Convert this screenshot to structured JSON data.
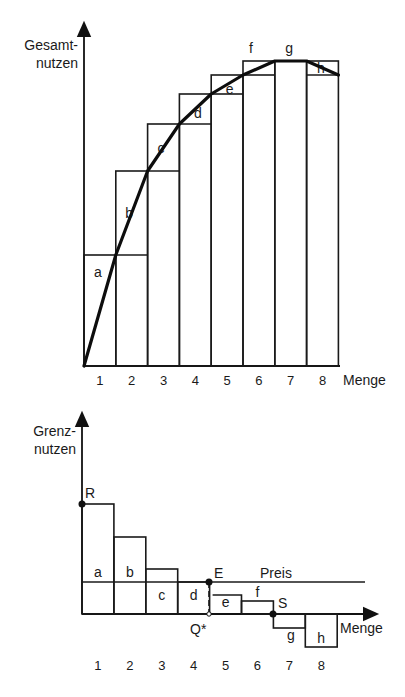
{
  "top_chart": {
    "y_axis_label_line1": "Gesamt-",
    "y_axis_label_line2": "nutzen",
    "x_axis_label": "Menge",
    "x_ticks": [
      "1",
      "2",
      "3",
      "4",
      "5",
      "6",
      "7",
      "8"
    ],
    "segment_labels": [
      "a",
      "b",
      "c",
      "d",
      "e",
      "f",
      "g",
      "h"
    ],
    "cumulative_total_utility": [
      0,
      111,
      195,
      242,
      272,
      291,
      305,
      305,
      291
    ]
  },
  "bottom_chart": {
    "y_axis_label_line1": "Grenz-",
    "y_axis_label_line2": "nutzen",
    "x_axis_label": "Menge",
    "x_ticks": [
      "1",
      "2",
      "3",
      "4",
      "5",
      "6",
      "7",
      "8"
    ],
    "segment_labels": [
      "a",
      "b",
      "c",
      "d",
      "e",
      "f",
      "g",
      "h"
    ],
    "point_labels": {
      "R": "R",
      "E": "E",
      "S": "S",
      "Q": "Q*"
    },
    "price_label": "Preis",
    "marginal_utility": [
      110,
      77,
      45,
      32,
      19,
      13,
      -14,
      -33
    ],
    "price": 32
  },
  "chart_data": [
    {
      "type": "bar",
      "title": "Gesamtnutzen",
      "xlabel": "Menge",
      "ylabel": "Gesamtnutzen",
      "categories": [
        "1",
        "2",
        "3",
        "4",
        "5",
        "6",
        "7",
        "8"
      ],
      "series": [
        {
          "name": "Gesamtnutzen (kumuliert)",
          "values": [
            111,
            195,
            242,
            272,
            291,
            305,
            305,
            291
          ]
        },
        {
          "name": "Zuwachs",
          "labels": [
            "a",
            "b",
            "c",
            "d",
            "e",
            "f",
            "g",
            "h"
          ],
          "values": [
            111,
            84,
            47,
            30,
            19,
            14,
            0,
            -14
          ]
        }
      ],
      "grid": false
    },
    {
      "type": "bar",
      "title": "Grenznutzen",
      "xlabel": "Menge",
      "ylabel": "Grenznutzen",
      "categories": [
        "1",
        "2",
        "3",
        "4",
        "5",
        "6",
        "7",
        "8"
      ],
      "series": [
        {
          "name": "Grenznutzen",
          "labels": [
            "a",
            "b",
            "c",
            "d",
            "e",
            "f",
            "g",
            "h"
          ],
          "values": [
            110,
            77,
            45,
            32,
            19,
            13,
            -14,
            -33
          ]
        }
      ],
      "annotations": [
        "R",
        "E",
        "S",
        "Q*",
        "Preis"
      ],
      "price_line": 32,
      "grid": false
    }
  ]
}
